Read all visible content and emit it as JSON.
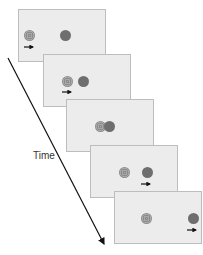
{
  "diagram": {
    "axis_label": "Time",
    "colors": {
      "panel_bg": "#ececec",
      "panel_border": "#bdbdbd",
      "solid_disc": "#6e6e6e",
      "textured_disc": "#a0a0a0",
      "arrow": "#111111"
    },
    "frames": [
      {
        "index": 1,
        "textured_disc_x": 6,
        "solid_disc_x": 42,
        "arrow_under": "textured"
      },
      {
        "index": 2,
        "textured_disc_x": 19,
        "solid_disc_x": 37,
        "arrow_under": "textured"
      },
      {
        "index": 3,
        "textured_disc_x": 29,
        "solid_disc_x": 38,
        "arrow_under": "none"
      },
      {
        "index": 4,
        "textured_disc_x": 29,
        "solid_disc_x": 52,
        "arrow_under": "solid"
      },
      {
        "index": 5,
        "textured_disc_x": 27,
        "solid_disc_x": 74,
        "arrow_under": "solid"
      }
    ]
  }
}
